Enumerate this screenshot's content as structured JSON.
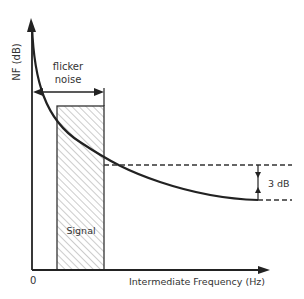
{
  "diagram": {
    "y_axis_label": "NF (dB)",
    "x_axis_label": "Intermediate Frequency (Hz)",
    "origin_label": "0",
    "flicker_label_line1": "flicker",
    "flicker_label_line2": "noise",
    "signal_label": "Signal",
    "delta_label": "3 dB"
  },
  "colors": {
    "stroke": "#222222",
    "hatch": "#888888",
    "text": "#333333"
  }
}
